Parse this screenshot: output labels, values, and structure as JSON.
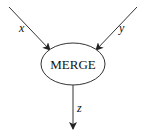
{
  "diagram": {
    "node": {
      "label": "MERGE",
      "shape": "ellipse"
    },
    "edges": [
      {
        "label": "x",
        "direction": "in",
        "from": "top-left"
      },
      {
        "label": "y",
        "direction": "in",
        "from": "top-right"
      },
      {
        "label": "z",
        "direction": "out",
        "to": "bottom"
      }
    ],
    "colors": {
      "stroke": "#333333",
      "background": "#ffffff"
    }
  }
}
